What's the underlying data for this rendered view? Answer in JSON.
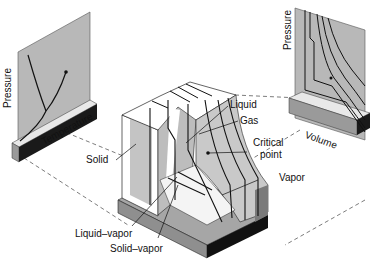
{
  "diagram": {
    "type": "pvt-phase-surface",
    "colors": {
      "surface_light": "#ffffff",
      "surface_shade": "#bdbdbd",
      "surface_dark": "#8a8a8a",
      "base_top": "#a6a6a6",
      "base_side": "#1a1a1a",
      "line": "#111111",
      "dashed": "#444444"
    },
    "left_panel": {
      "y_axis_label": "Pressure",
      "x_axis_label": "Temperature"
    },
    "right_panel": {
      "y_axis_label": "Pressure",
      "x_axis_label": "Volume"
    },
    "region_labels": {
      "solid": "Solid",
      "liquid": "Liquid",
      "gas": "Gas",
      "critical_point_line1": "Critical",
      "critical_point_line2": "point",
      "vapor": "Vapor",
      "liquid_vapor": "Liquid–vapor",
      "solid_vapor": "Solid–vapor"
    }
  }
}
